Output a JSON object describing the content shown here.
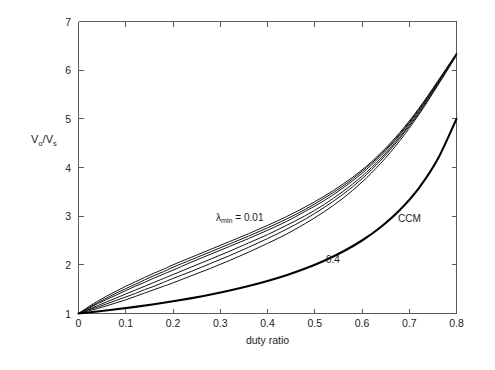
{
  "figure": {
    "background_color": "#ffffff",
    "axis_color": "#5a5a5a",
    "curve_color": "#151515",
    "ccm_color": "#000000"
  },
  "chart_data": {
    "type": "line",
    "title": "",
    "xlabel": "duty ratio",
    "ylabel": "Vo/Vs",
    "ylabel_parts": {
      "num": "V",
      "num_sub": "o",
      "slash": "/V",
      "den_sub": "s"
    },
    "xlim": [
      0,
      0.8
    ],
    "ylim": [
      1,
      7
    ],
    "xticks": [
      0,
      0.1,
      0.2,
      0.3,
      0.4,
      0.5,
      0.6,
      0.7,
      0.8
    ],
    "xticklabels": [
      "0",
      "0.1",
      "0.2",
      "0.3",
      "0.4",
      "0.5",
      "0.6",
      "0.7",
      "0.8"
    ],
    "yticks": [
      1,
      2,
      3,
      4,
      5,
      6,
      7
    ],
    "yticklabels": [
      "1",
      "2",
      "3",
      "4",
      "5",
      "6",
      "7"
    ],
    "grid": false,
    "legend": "none",
    "annotations": [
      {
        "name": "lambda-min-label",
        "text_main": "λ",
        "text_sub": "min",
        "text_tail": " = 0.01",
        "x": 0.335,
        "y": 2.72
      },
      {
        "name": "lambda-0p4-label",
        "text": "0.4",
        "x": 0.525,
        "y": 2.05
      },
      {
        "name": "ccm-label",
        "text": "CCM",
        "x": 0.72,
        "y": 2.73
      }
    ],
    "series": [
      {
        "name": "lambda_min = 0.01",
        "lambda": 0.01,
        "style": "thin",
        "x": [
          0,
          0.02,
          0.04,
          0.06,
          0.08,
          0.1,
          0.12,
          0.14,
          0.16,
          0.18,
          0.2,
          0.24,
          0.28,
          0.32,
          0.36,
          0.4,
          0.44,
          0.48,
          0.52,
          0.56,
          0.6,
          0.64,
          0.68,
          0.72,
          0.76,
          0.8
        ],
        "y": [
          1.0,
          1.13,
          1.25,
          1.36,
          1.46,
          1.56,
          1.65,
          1.74,
          1.83,
          1.91,
          2.0,
          2.16,
          2.32,
          2.48,
          2.64,
          2.81,
          2.99,
          3.19,
          3.41,
          3.66,
          3.95,
          4.3,
          4.72,
          5.21,
          5.77,
          6.35
        ]
      },
      {
        "name": "lambda_min = 0.05",
        "lambda": 0.05,
        "style": "thin",
        "x": [
          0,
          0.02,
          0.04,
          0.06,
          0.08,
          0.1,
          0.12,
          0.14,
          0.16,
          0.18,
          0.2,
          0.24,
          0.28,
          0.32,
          0.36,
          0.4,
          0.44,
          0.48,
          0.52,
          0.56,
          0.6,
          0.64,
          0.68,
          0.72,
          0.76,
          0.8
        ],
        "y": [
          1.0,
          1.11,
          1.22,
          1.32,
          1.42,
          1.51,
          1.6,
          1.69,
          1.78,
          1.86,
          1.95,
          2.11,
          2.27,
          2.43,
          2.59,
          2.76,
          2.94,
          3.14,
          3.37,
          3.62,
          3.92,
          4.27,
          4.69,
          5.19,
          5.76,
          6.34
        ]
      },
      {
        "name": "lambda_min = 0.1",
        "lambda": 0.1,
        "style": "thin",
        "x": [
          0,
          0.02,
          0.04,
          0.06,
          0.08,
          0.1,
          0.12,
          0.14,
          0.16,
          0.18,
          0.2,
          0.24,
          0.28,
          0.32,
          0.36,
          0.4,
          0.44,
          0.48,
          0.52,
          0.56,
          0.6,
          0.64,
          0.68,
          0.72,
          0.76,
          0.8
        ],
        "y": [
          1.0,
          1.1,
          1.2,
          1.29,
          1.38,
          1.47,
          1.56,
          1.64,
          1.73,
          1.81,
          1.89,
          2.06,
          2.22,
          2.38,
          2.54,
          2.71,
          2.89,
          3.1,
          3.32,
          3.58,
          3.88,
          4.24,
          4.67,
          5.17,
          5.74,
          6.33
        ]
      },
      {
        "name": "lambda_min = 0.2",
        "lambda": 0.2,
        "style": "thin",
        "x": [
          0,
          0.02,
          0.04,
          0.06,
          0.08,
          0.1,
          0.12,
          0.14,
          0.16,
          0.18,
          0.2,
          0.24,
          0.28,
          0.32,
          0.36,
          0.4,
          0.44,
          0.48,
          0.52,
          0.56,
          0.6,
          0.64,
          0.68,
          0.72,
          0.76,
          0.8
        ],
        "y": [
          1.0,
          1.08,
          1.16,
          1.24,
          1.32,
          1.4,
          1.48,
          1.56,
          1.64,
          1.72,
          1.8,
          1.96,
          2.12,
          2.28,
          2.45,
          2.62,
          2.81,
          3.01,
          3.24,
          3.51,
          3.82,
          4.19,
          4.63,
          5.14,
          5.72,
          6.32
        ]
      },
      {
        "name": "lambda_min = 0.3",
        "lambda": 0.3,
        "style": "thin",
        "x": [
          0,
          0.02,
          0.04,
          0.06,
          0.08,
          0.1,
          0.12,
          0.14,
          0.16,
          0.18,
          0.2,
          0.24,
          0.28,
          0.32,
          0.36,
          0.4,
          0.44,
          0.48,
          0.52,
          0.56,
          0.6,
          0.64,
          0.68,
          0.72,
          0.76,
          0.8
        ],
        "y": [
          1.0,
          1.07,
          1.13,
          1.2,
          1.27,
          1.34,
          1.41,
          1.49,
          1.56,
          1.64,
          1.72,
          1.87,
          2.03,
          2.19,
          2.36,
          2.54,
          2.73,
          2.94,
          3.18,
          3.45,
          3.77,
          4.15,
          4.6,
          5.11,
          5.7,
          6.31
        ]
      },
      {
        "name": "lambda_min = 0.4",
        "lambda": 0.4,
        "style": "thin",
        "x": [
          0,
          0.02,
          0.04,
          0.06,
          0.08,
          0.1,
          0.12,
          0.14,
          0.16,
          0.18,
          0.2,
          0.24,
          0.28,
          0.32,
          0.36,
          0.4,
          0.44,
          0.48,
          0.52,
          0.56,
          0.6,
          0.64,
          0.68,
          0.72,
          0.76,
          0.8
        ],
        "y": [
          1.0,
          1.05,
          1.1,
          1.16,
          1.22,
          1.28,
          1.35,
          1.42,
          1.49,
          1.56,
          1.63,
          1.78,
          1.93,
          2.09,
          2.26,
          2.44,
          2.63,
          2.85,
          3.09,
          3.37,
          3.7,
          4.09,
          4.55,
          5.08,
          5.68,
          6.3
        ]
      },
      {
        "name": "CCM",
        "style": "thick",
        "x": [
          0,
          0.04,
          0.08,
          0.12,
          0.16,
          0.2,
          0.24,
          0.28,
          0.32,
          0.36,
          0.4,
          0.44,
          0.48,
          0.52,
          0.56,
          0.6,
          0.64,
          0.68,
          0.72,
          0.76,
          0.8
        ],
        "y": [
          1.0,
          1.042,
          1.087,
          1.136,
          1.19,
          1.25,
          1.316,
          1.389,
          1.471,
          1.563,
          1.667,
          1.786,
          1.923,
          2.083,
          2.273,
          2.5,
          2.778,
          3.125,
          3.571,
          4.167,
          5.0
        ]
      }
    ]
  }
}
